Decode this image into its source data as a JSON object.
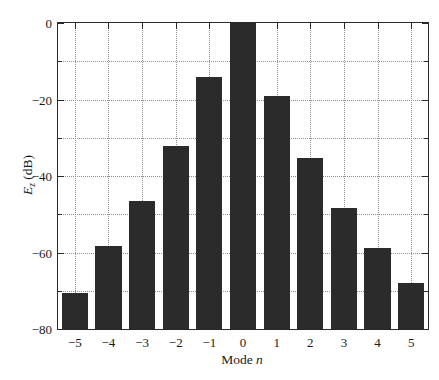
{
  "figure": {
    "background_color": "#ffffff",
    "bar_color": "#2b2b2b",
    "axis_color": "#2a2a2a",
    "grid_color": "#8d8d8d"
  },
  "axes": {
    "x_title_main": "Mode",
    "x_title_var": "n",
    "y_title_main": "E",
    "y_title_sub": "z",
    "y_title_unit": " (dB)"
  },
  "chart_data": {
    "type": "bar",
    "title": "",
    "xlabel": "Mode n",
    "ylabel": "E_z (dB)",
    "categories": [
      "-5",
      "-4",
      "-3",
      "-2",
      "-1",
      "0",
      "1",
      "2",
      "3",
      "4",
      "5"
    ],
    "values": [
      -70.5,
      -58.3,
      -46.5,
      -32.2,
      -14.1,
      0,
      -19.1,
      -35.3,
      -48.4,
      -58.8,
      -68.0
    ],
    "xlim": [
      -5.5,
      5.5
    ],
    "ylim": [
      -80,
      0
    ],
    "y_major_ticks": [
      0,
      -20,
      -40,
      -60,
      -80
    ],
    "y_major_tick_labels": [
      "0",
      "-20",
      "-40",
      "-60",
      "-80"
    ],
    "y_minor_ticks": [
      -10,
      -30,
      -50,
      -70
    ],
    "x_ticks": [
      -5,
      -4,
      -3,
      -2,
      -1,
      0,
      1,
      2,
      3,
      4,
      5
    ],
    "x_tick_labels": [
      "-5",
      "-4",
      "-3",
      "-2",
      "-1",
      "0",
      "1",
      "2",
      "3",
      "4",
      "5"
    ],
    "grid": true,
    "grid_style": "dotted",
    "legend": null,
    "bar_width_fraction": 0.78
  }
}
